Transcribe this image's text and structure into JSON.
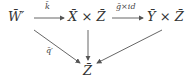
{
  "diagram": {
    "type": "commutative-diagram",
    "nodes": {
      "w": "W̄′",
      "xz": "X̄ × Z̄",
      "yz": "Ȳ × Z̄",
      "z": "Z̄"
    },
    "arrows": {
      "w_to_xz": "k̄",
      "xz_to_yz": "ḡ×id",
      "w_to_z": "q̄′",
      "xz_to_z": "",
      "yz_to_z": ""
    }
  }
}
